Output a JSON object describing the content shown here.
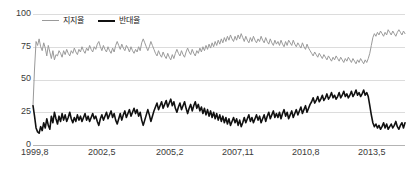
{
  "chart_data": {
    "type": "line",
    "title": "",
    "xlabel": "",
    "ylabel": "",
    "ylim": [
      0,
      100
    ],
    "yticks": [
      0,
      25,
      50,
      75,
      100
    ],
    "grid": true,
    "legend_position": "top-left",
    "x_tick_labels": [
      "1999,8",
      "2002,5",
      "2005,2",
      "2007,11",
      "2010,8",
      "2013,5"
    ],
    "x_tick_positions": [
      0,
      0.1818,
      0.3636,
      0.5454,
      0.7272,
      0.909
    ],
    "x_range_label": [
      "1999,8",
      "2015,8"
    ],
    "colors": {
      "support": "#9a9a9a",
      "oppose": "#111111",
      "grid": "#dcdcdc",
      "axis": "#b4b4b4"
    },
    "series": [
      {
        "name": "지지율",
        "color": "#9a9a9a",
        "values": [
          30,
          58,
          79,
          76,
          81,
          75,
          72,
          78,
          74,
          68,
          76,
          71,
          66,
          72,
          65,
          69,
          68,
          72,
          70,
          67,
          72,
          69,
          73,
          70,
          68,
          72,
          70,
          74,
          71,
          69,
          73,
          71,
          75,
          72,
          70,
          74,
          72,
          76,
          73,
          71,
          75,
          73,
          77,
          79,
          75,
          72,
          76,
          73,
          71,
          75,
          72,
          70,
          74,
          71,
          76,
          79,
          76,
          73,
          77,
          74,
          72,
          76,
          74,
          71,
          75,
          72,
          70,
          73,
          71,
          75,
          72,
          78,
          81,
          78,
          75,
          72,
          75,
          79,
          76,
          73,
          70,
          68,
          72,
          69,
          67,
          71,
          68,
          66,
          70,
          67,
          65,
          69,
          66,
          70,
          73,
          70,
          68,
          72,
          69,
          67,
          71,
          74,
          71,
          69,
          73,
          70,
          68,
          72,
          70,
          74,
          71,
          75,
          72,
          76,
          73,
          77,
          74,
          78,
          75,
          79,
          76,
          80,
          77,
          81,
          78,
          82,
          79,
          83,
          80,
          84,
          81,
          79,
          83,
          80,
          84,
          81,
          85,
          82,
          79,
          83,
          80,
          78,
          82,
          79,
          83,
          80,
          78,
          81,
          79,
          83,
          80,
          78,
          82,
          79,
          77,
          81,
          78,
          76,
          80,
          77,
          79,
          76,
          80,
          77,
          75,
          79,
          76,
          80,
          78,
          76,
          80,
          77,
          75,
          78,
          76,
          74,
          78,
          75,
          73,
          77,
          74,
          72,
          70,
          68,
          71,
          69,
          67,
          70,
          68,
          66,
          69,
          67,
          65,
          68,
          66,
          64,
          67,
          65,
          68,
          66,
          64,
          67,
          65,
          63,
          66,
          64,
          67,
          65,
          63,
          66,
          64,
          62,
          65,
          63,
          66,
          64,
          62,
          65,
          63,
          66,
          70,
          76,
          82,
          85,
          83,
          86,
          84,
          87,
          85,
          83,
          86,
          84,
          88,
          86,
          84,
          87,
          85,
          83,
          86,
          88,
          86,
          84,
          87,
          85
        ]
      },
      {
        "name": "반대율",
        "color": "#111111",
        "values": [
          30,
          22,
          13,
          10,
          9,
          14,
          11,
          17,
          13,
          20,
          15,
          12,
          22,
          17,
          25,
          20,
          16,
          22,
          18,
          24,
          19,
          23,
          18,
          21,
          25,
          20,
          17,
          21,
          18,
          23,
          19,
          22,
          18,
          21,
          24,
          19,
          22,
          18,
          21,
          24,
          20,
          22,
          18,
          15,
          20,
          23,
          19,
          22,
          25,
          20,
          23,
          26,
          21,
          24,
          19,
          16,
          20,
          24,
          19,
          23,
          26,
          21,
          24,
          27,
          22,
          25,
          28,
          24,
          27,
          22,
          25,
          19,
          15,
          19,
          23,
          27,
          23,
          18,
          22,
          26,
          29,
          32,
          27,
          30,
          33,
          28,
          31,
          34,
          29,
          32,
          35,
          30,
          33,
          28,
          25,
          29,
          32,
          27,
          30,
          33,
          28,
          24,
          28,
          31,
          26,
          30,
          33,
          28,
          31,
          26,
          29,
          24,
          28,
          23,
          27,
          22,
          26,
          21,
          25,
          20,
          24,
          19,
          23,
          18,
          22,
          17,
          21,
          16,
          20,
          15,
          18,
          21,
          17,
          20,
          15,
          19,
          14,
          17,
          21,
          17,
          20,
          23,
          18,
          21,
          17,
          20,
          23,
          19,
          22,
          17,
          20,
          23,
          18,
          22,
          25,
          20,
          23,
          26,
          21,
          24,
          21,
          25,
          20,
          24,
          27,
          22,
          25,
          20,
          23,
          26,
          21,
          24,
          27,
          23,
          26,
          29,
          24,
          27,
          30,
          25,
          28,
          31,
          33,
          36,
          32,
          34,
          37,
          33,
          35,
          38,
          34,
          36,
          39,
          35,
          37,
          40,
          36,
          38,
          35,
          37,
          40,
          36,
          38,
          41,
          37,
          39,
          36,
          38,
          41,
          37,
          39,
          42,
          38,
          40,
          37,
          39,
          42,
          38,
          40,
          37,
          30,
          23,
          17,
          14,
          16,
          13,
          15,
          12,
          14,
          17,
          13,
          16,
          12,
          14,
          16,
          13,
          15,
          18,
          14,
          12,
          15,
          17,
          13,
          17
        ]
      }
    ]
  },
  "legend": {
    "items": [
      {
        "label": "지지율",
        "key": "support"
      },
      {
        "label": "반대율",
        "key": "oppose"
      }
    ]
  },
  "axes": {
    "y_labels": [
      "100",
      "75",
      "50",
      "25",
      "0"
    ],
    "x_labels": [
      "1999,8",
      "2002,5",
      "2005,2",
      "2007,11",
      "2010,8",
      "2013,5"
    ]
  }
}
